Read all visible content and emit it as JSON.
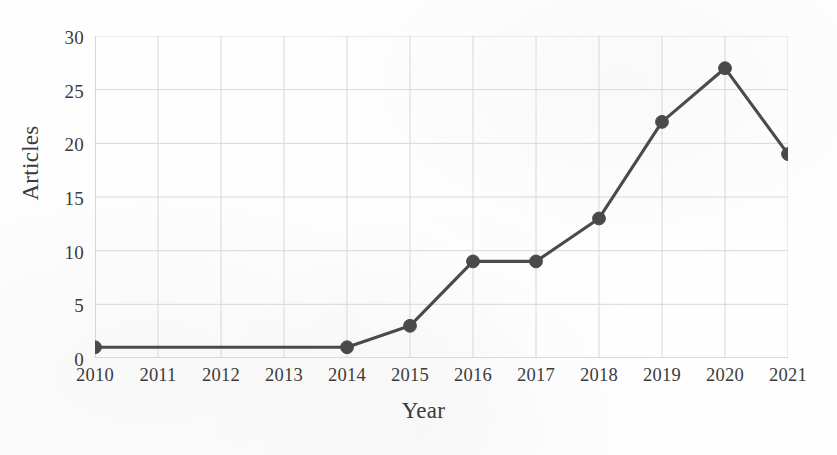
{
  "chart_data": {
    "type": "line",
    "title": "",
    "subtitle": "",
    "xlabel": "Year",
    "ylabel": "Articles",
    "categories": [
      "2010",
      "2011",
      "2012",
      "2013",
      "2014",
      "2015",
      "2016",
      "2017",
      "2018",
      "2019",
      "2020",
      "2021"
    ],
    "values": [
      1,
      1,
      1,
      1,
      1,
      3,
      9,
      9,
      13,
      22,
      27,
      19
    ],
    "markers_shown_at": [
      "2010",
      "2014",
      "2015",
      "2016",
      "2017",
      "2018",
      "2019",
      "2020",
      "2021"
    ],
    "x_tick_labels": [
      "2010",
      "2011",
      "2012",
      "2013",
      "2014",
      "2015",
      "2016",
      "2017",
      "2018",
      "2019",
      "2020",
      "2021"
    ],
    "y_tick_labels": [
      "0",
      "5",
      "10",
      "15",
      "20",
      "25",
      "30"
    ],
    "y_ticks": [
      0,
      5,
      10,
      15,
      20,
      25,
      30
    ],
    "ylim": [
      0,
      30
    ],
    "xlim": [
      "2010",
      "2021"
    ],
    "grid": true,
    "grid_axes": "both",
    "legend": false,
    "legend_position": "none",
    "series": [
      {
        "name": "Articles",
        "values": [
          1,
          1,
          1,
          1,
          1,
          3,
          9,
          9,
          13,
          22,
          27,
          19
        ]
      }
    ],
    "annotations": []
  },
  "style": {
    "line_color": "#4a4a4a",
    "marker_color": "#4a4a4a",
    "grid_color": "#d8d8d8",
    "axis_color": "#c9c9c9",
    "text_color": "#3b3b3b",
    "background_color": "#fefefe"
  }
}
